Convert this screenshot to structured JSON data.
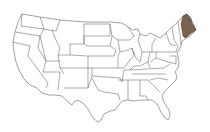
{
  "map": {
    "type": "choropleth",
    "region": "United States",
    "highlighted_states": [
      "Maine"
    ],
    "colors": {
      "highlight": "#7a6050",
      "default_fill": "#ffffff",
      "border": "#555555",
      "background": "#ffffff"
    }
  }
}
